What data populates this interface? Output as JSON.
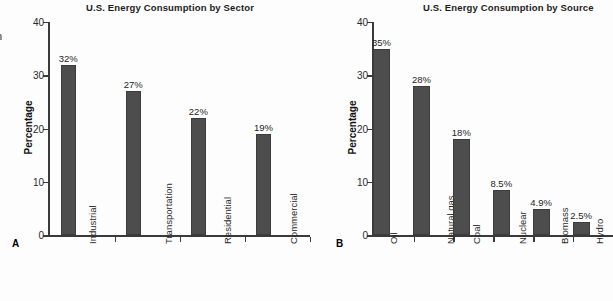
{
  "figure": {
    "background": "#fdfdfd",
    "bar_color": "#4d4d4d",
    "axis_color": "#3a3a3a",
    "edge_fragment": "n"
  },
  "panels": [
    {
      "key": "A",
      "label": "A",
      "chart_data": {
        "type": "bar",
        "title": "U.S. Energy Consumption by Sector",
        "xlabel": "",
        "ylabel": "Percentage",
        "categories": [
          "Industrial",
          "Transportation",
          "Residential",
          "Commercial"
        ],
        "values": [
          32,
          27,
          22,
          19
        ],
        "value_labels": [
          "32%",
          "27%",
          "22%",
          "19%"
        ],
        "ylim": [
          0,
          40
        ],
        "yticks": [
          0,
          10,
          20,
          30,
          40
        ],
        "ytick_labels": [
          "0",
          "10",
          "20",
          "30",
          "40"
        ],
        "grid": false,
        "legend": "none"
      }
    },
    {
      "key": "B",
      "label": "B",
      "chart_data": {
        "type": "bar",
        "title": "U.S. Energy Consumption by Source",
        "xlabel": "",
        "ylabel": "Percentage",
        "categories": [
          "Oil",
          "Natural gas",
          "Coal",
          "Nuclear",
          "Biomass",
          "Hydro"
        ],
        "values": [
          35,
          28,
          18,
          8.5,
          4.9,
          2.5
        ],
        "value_labels": [
          "35%",
          "28%",
          "18%",
          "8.5%",
          "4.9%",
          "2.5%"
        ],
        "ylim": [
          0,
          40
        ],
        "yticks": [
          0,
          10,
          20,
          30,
          40
        ],
        "ytick_labels": [
          "0",
          "10",
          "20",
          "30",
          "40"
        ],
        "grid": false,
        "legend": "none"
      }
    }
  ]
}
